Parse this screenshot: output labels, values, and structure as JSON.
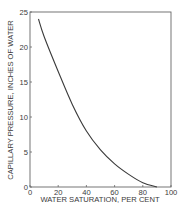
{
  "chart_data": {
    "type": "line",
    "title": "",
    "xlabel": "WATER SATURATION, PER CENT",
    "ylabel": "CAPILLARY PRESSURE, INCHES OF WATER",
    "xlim": [
      0,
      100
    ],
    "ylim": [
      0,
      25
    ],
    "x_ticks": [
      0,
      20,
      40,
      60,
      80,
      100
    ],
    "y_ticks": [
      0,
      5,
      10,
      15,
      20,
      25
    ],
    "x_tick_labels": [
      "0",
      "20",
      "40",
      "60",
      "80",
      "100"
    ],
    "y_tick_labels": [
      "0",
      "5",
      "10",
      "15",
      "20",
      "25"
    ],
    "grid": false,
    "legend": null,
    "series": [
      {
        "name": "Capillary pressure curve",
        "x": [
          6,
          10,
          20,
          30,
          40,
          50,
          60,
          70,
          80,
          90
        ],
        "y": [
          24,
          21.5,
          16.5,
          11.8,
          8,
          5.3,
          3.3,
          1.8,
          0.6,
          0
        ]
      }
    ],
    "colors": {
      "line": "#3a3a3a",
      "axes": "#555555",
      "background": "#ffffff"
    }
  }
}
